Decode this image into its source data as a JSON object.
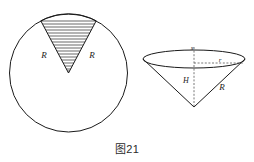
{
  "figure": {
    "caption": "图21",
    "colors": {
      "ink": "#1a1a1a",
      "hatch": "#2a2a2a",
      "dashed": "#555555",
      "background": "#ffffff"
    },
    "left_diagram": {
      "name": "circle-with-hatched-sector",
      "shape": "circle",
      "sector_fill": "horizontal-hatching",
      "labels": [
        {
          "id": "left-radius",
          "text": "R",
          "x": 44,
          "y": 58
        },
        {
          "id": "right-radius",
          "text": "R",
          "x": 92,
          "y": 58
        }
      ],
      "geometry": {
        "center_x": 68.5,
        "center_y": 73,
        "radius": 59,
        "sector_start_angle_deg": 118,
        "sector_end_angle_deg": 62
      }
    },
    "right_diagram": {
      "name": "cone",
      "shape": "cone",
      "labels": [
        {
          "id": "top-mark",
          "text": "s",
          "x": 192,
          "y": 50
        },
        {
          "id": "base-radius",
          "text": "r",
          "x": 219,
          "y": 64
        },
        {
          "id": "height",
          "text": "H",
          "x": 186,
          "y": 82
        },
        {
          "id": "slant",
          "text": "R",
          "x": 221,
          "y": 89
        }
      ],
      "geometry": {
        "ellipse_center_x": 194,
        "ellipse_center_y": 59,
        "ellipse_rx": 51,
        "ellipse_ry": 9,
        "apex_x": 194,
        "apex_y": 107
      }
    }
  }
}
